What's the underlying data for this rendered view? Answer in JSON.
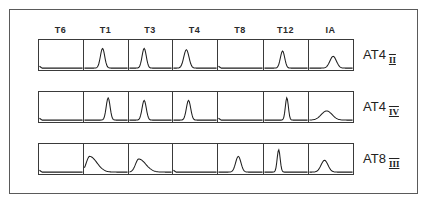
{
  "chart_data": {
    "type": "histogram-grid",
    "title": "",
    "columns": [
      "T6",
      "T1",
      "T3",
      "T4",
      "T8",
      "T12",
      "IA"
    ],
    "rows": [
      {
        "label": "AT4",
        "subscript": "II",
        "histograms": [
          {
            "column": "T6",
            "peak": false,
            "peak_pos": null,
            "height": 0,
            "width": 0
          },
          {
            "column": "T1",
            "peak": true,
            "peak_pos": 0.42,
            "height": 0.75,
            "width": 0.1
          },
          {
            "column": "T3",
            "peak": true,
            "peak_pos": 0.35,
            "height": 0.75,
            "width": 0.1
          },
          {
            "column": "T4",
            "peak": true,
            "peak_pos": 0.3,
            "height": 0.7,
            "width": 0.12
          },
          {
            "column": "T8",
            "peak": false,
            "peak_pos": null,
            "height": 0,
            "width": 0
          },
          {
            "column": "T12",
            "peak": true,
            "peak_pos": 0.42,
            "height": 0.65,
            "width": 0.1
          },
          {
            "column": "IA",
            "peak": true,
            "peak_pos": 0.55,
            "height": 0.45,
            "width": 0.15
          }
        ]
      },
      {
        "label": "AT4",
        "subscript": "IV",
        "histograms": [
          {
            "column": "T6",
            "peak": false,
            "peak_pos": null,
            "height": 0,
            "width": 0
          },
          {
            "column": "T1",
            "peak": true,
            "peak_pos": 0.55,
            "height": 0.85,
            "width": 0.09
          },
          {
            "column": "T3",
            "peak": true,
            "peak_pos": 0.35,
            "height": 0.75,
            "width": 0.1
          },
          {
            "column": "T4",
            "peak": true,
            "peak_pos": 0.35,
            "height": 0.75,
            "width": 0.1
          },
          {
            "column": "T8",
            "peak": false,
            "peak_pos": null,
            "height": 0,
            "width": 0
          },
          {
            "column": "T12",
            "peak": true,
            "peak_pos": 0.52,
            "height": 0.85,
            "width": 0.07
          },
          {
            "column": "IA",
            "peak": true,
            "peak_pos": 0.4,
            "height": 0.35,
            "width": 0.25
          }
        ]
      },
      {
        "label": "AT8",
        "subscript": "III",
        "histograms": [
          {
            "column": "T6",
            "peak": false,
            "peak_pos": null,
            "height": 0,
            "width": 0
          },
          {
            "column": "T1",
            "peak": true,
            "peak_pos": 0.12,
            "height": 0.6,
            "width": 0.15
          },
          {
            "column": "T3",
            "peak": true,
            "peak_pos": 0.22,
            "height": 0.5,
            "width": 0.15
          },
          {
            "column": "T4",
            "peak": false,
            "peak_pos": null,
            "height": 0,
            "width": 0
          },
          {
            "column": "T8",
            "peak": true,
            "peak_pos": 0.45,
            "height": 0.6,
            "width": 0.12
          },
          {
            "column": "T12",
            "peak": true,
            "peak_pos": 0.33,
            "height": 0.85,
            "width": 0.07
          },
          {
            "column": "IA",
            "peak": true,
            "peak_pos": 0.35,
            "height": 0.45,
            "width": 0.16
          }
        ]
      }
    ],
    "xlabel": "",
    "ylabel": "",
    "grid": false,
    "legend": null
  }
}
